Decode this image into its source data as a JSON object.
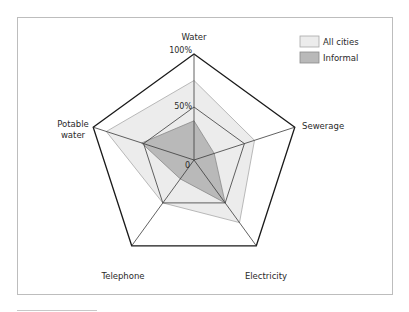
{
  "chart_data": {
    "type": "radar",
    "title": "",
    "axes": [
      "Water",
      "Sewerage",
      "Electricity",
      "Telephone",
      "Potable water"
    ],
    "axis_labels": {
      "water": "Water",
      "sewerage": "Sewerage",
      "electricity": "Electricity",
      "telephone": "Telephone",
      "potable_water_line1": "Potable",
      "potable_water_line2": "water"
    },
    "ticks": {
      "zero": "0",
      "fifty": "50%",
      "hundred": "100%"
    },
    "range": [
      0,
      100
    ],
    "grid_levels": [
      50,
      100
    ],
    "legend_position": "top-right",
    "series": [
      {
        "name": "All cities",
        "values": [
          75,
          60,
          73,
          50,
          87
        ],
        "color": "#ececec",
        "stroke": "#a8a8a8"
      },
      {
        "name": "Informal",
        "values": [
          37,
          20,
          50,
          22,
          52
        ],
        "color": "#b9b9b9",
        "stroke": "#8a8a8a"
      }
    ]
  },
  "legend": {
    "all_cities": "All cities",
    "informal": "Informal"
  }
}
